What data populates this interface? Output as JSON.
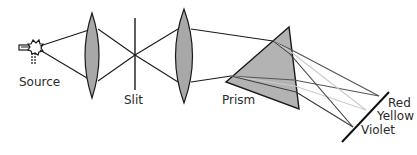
{
  "diagram": {
    "labels": {
      "source": "Source",
      "slit": "Slit",
      "prism": "Prism",
      "red": "Red",
      "yellow": "Yellow",
      "violet": "Violet"
    },
    "colors": {
      "lens_fill": "#a8a8a8",
      "prism_fill": "#b3b3b3",
      "outline": "#1a1a1a",
      "ray_red": "#555555",
      "ray_yellow": "#cccccc",
      "ray_violet": "#3a3a3a"
    },
    "components": [
      "light-source",
      "collimating-lens",
      "slit",
      "focusing-lens",
      "prism",
      "screen"
    ]
  }
}
